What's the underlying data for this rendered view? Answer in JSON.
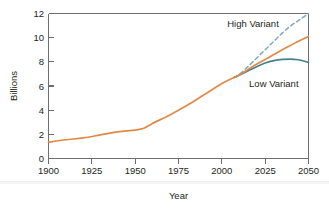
{
  "figure": {
    "kind": "line-chart",
    "background_color": "#ffffff"
  },
  "chart_data": {
    "type": "line",
    "title": "",
    "xlabel": "Year",
    "ylabel": "Billions",
    "xlim": [
      1900,
      2050
    ],
    "ylim": [
      0,
      12
    ],
    "xticks": [
      1900,
      1925,
      1950,
      1975,
      2000,
      2025,
      2050
    ],
    "xticklabels": [
      "1900",
      "1925",
      "1950",
      "1975",
      "2000",
      "2025",
      "2050"
    ],
    "yticks": [
      0,
      2,
      4,
      6,
      8,
      10,
      12
    ],
    "yticklabels": [
      "0",
      "2",
      "4",
      "6",
      "8",
      "10",
      "12"
    ],
    "grid": false,
    "legend": "inline-annotations",
    "annotations": [
      {
        "text": "High Variant",
        "x": 2018,
        "y": 10.9,
        "color": "#231f20"
      },
      {
        "text": "Low Variant",
        "x": 2030,
        "y": 5.9,
        "color": "#231f20"
      }
    ],
    "series": [
      {
        "name": "Historical / Medium Variant",
        "color": "#e08a48",
        "style": "solid",
        "width": 1.7,
        "x": [
          1900,
          1910,
          1920,
          1930,
          1940,
          1950,
          1955,
          1960,
          1970,
          1980,
          1990,
          2000,
          2007,
          2010,
          2020,
          2030,
          2040,
          2050
        ],
        "y": [
          1.35,
          1.55,
          1.7,
          1.95,
          2.2,
          2.35,
          2.5,
          2.9,
          3.6,
          4.4,
          5.3,
          6.2,
          6.7,
          6.9,
          7.8,
          8.6,
          9.4,
          10.1
        ]
      },
      {
        "name": "High Variant",
        "color": "#7fa9b8",
        "style": "dashed",
        "width": 1.5,
        "dash": "4,3",
        "x": [
          2007,
          2010,
          2015,
          2020,
          2025,
          2030,
          2035,
          2040,
          2045,
          2050
        ],
        "y": [
          6.7,
          6.95,
          7.6,
          8.3,
          9.0,
          9.7,
          10.4,
          11.0,
          11.5,
          12.0
        ]
      },
      {
        "name": "Low Variant",
        "color": "#45808f",
        "style": "solid",
        "width": 1.7,
        "x": [
          2007,
          2010,
          2015,
          2020,
          2025,
          2030,
          2035,
          2040,
          2042,
          2045,
          2050
        ],
        "y": [
          6.7,
          6.9,
          7.25,
          7.6,
          7.9,
          8.1,
          8.2,
          8.22,
          8.2,
          8.15,
          7.95
        ]
      }
    ]
  },
  "axes": {
    "y_axis_title": "Billions",
    "x_axis_title": "Year"
  },
  "colors": {
    "orange": "#e08a48",
    "teal": "#45808f",
    "dashed_blue": "#7fa9b8",
    "frame": "#6c6f72",
    "text": "#231f20"
  }
}
